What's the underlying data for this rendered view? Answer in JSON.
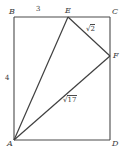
{
  "figure": {
    "kind": "geometry-diagram",
    "stroke_color": "#4a4a4a",
    "label_color": "#3a3a3a",
    "background_color": "#ffffff",
    "vertices": [
      {
        "name": "B",
        "label": "B",
        "x": 14,
        "y": 17
      },
      {
        "name": "C",
        "label": "C",
        "x": 110,
        "y": 17
      },
      {
        "name": "D",
        "label": "D",
        "x": 110,
        "y": 140
      },
      {
        "name": "A",
        "label": "A",
        "x": 14,
        "y": 140
      },
      {
        "name": "E",
        "label": "E",
        "x": 68,
        "y": 17
      },
      {
        "name": "F",
        "label": "F",
        "x": 110,
        "y": 56
      }
    ],
    "segments": [
      {
        "name": "side-BC",
        "from": "B",
        "to": "C"
      },
      {
        "name": "side-CD",
        "from": "C",
        "to": "D"
      },
      {
        "name": "side-DA",
        "from": "D",
        "to": "A"
      },
      {
        "name": "side-AB",
        "from": "A",
        "to": "B"
      },
      {
        "name": "segment-AE",
        "from": "A",
        "to": "E"
      },
      {
        "name": "segment-EF",
        "from": "E",
        "to": "F"
      },
      {
        "name": "segment-AF",
        "from": "A",
        "to": "F"
      }
    ],
    "measures": {
      "be": "3",
      "ab": "4",
      "ef_symbol": "√",
      "ef_value": "2",
      "af_symbol": "√",
      "af_value": "17"
    }
  }
}
